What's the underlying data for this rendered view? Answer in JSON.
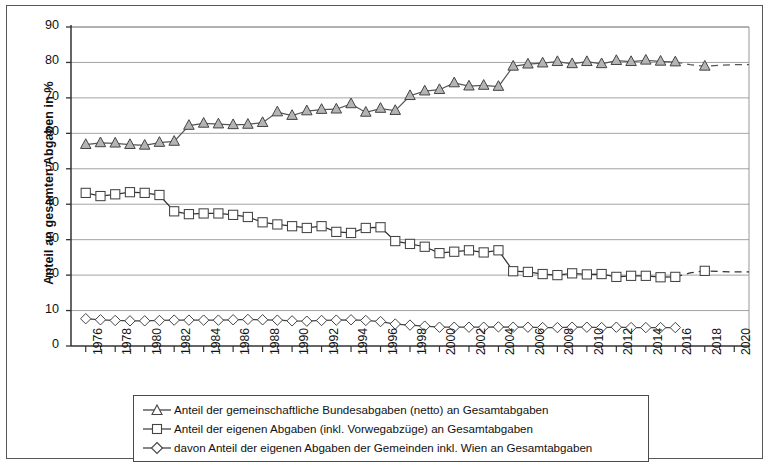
{
  "chart_data": {
    "type": "line",
    "title": "",
    "subtitle": "",
    "xlabel": "",
    "ylabel": "Anteil an gesamten Abgaben in %",
    "ylim": [
      0,
      90
    ],
    "ytick_step": 10,
    "yticks": [
      0,
      10,
      20,
      30,
      40,
      50,
      60,
      70,
      80,
      90
    ],
    "xlim": [
      1975,
      2021
    ],
    "xticks": [
      1976,
      1978,
      1980,
      1982,
      1984,
      1986,
      1988,
      1990,
      1992,
      1994,
      1996,
      1998,
      2000,
      2002,
      2004,
      2006,
      2008,
      2010,
      2012,
      2014,
      2016,
      2018,
      2020
    ],
    "x": [
      1976,
      1977,
      1978,
      1979,
      1980,
      1981,
      1982,
      1983,
      1984,
      1985,
      1986,
      1987,
      1988,
      1989,
      1990,
      1991,
      1992,
      1993,
      1994,
      1995,
      1996,
      1997,
      1998,
      1999,
      2000,
      2001,
      2002,
      2003,
      2004,
      2005,
      2006,
      2007,
      2008,
      2009,
      2010,
      2011,
      2012,
      2013,
      2014,
      2015,
      2016,
      2017,
      2018,
      2019,
      2020,
      2021
    ],
    "grid": true,
    "grid_axis": "y",
    "legend_position": "below",
    "series": [
      {
        "name": "Anteil der gemeinschaftliche Bundesabgaben (netto) an Gesamtabgaben",
        "marker": "triangle",
        "marker_fill": "#b4b4b4",
        "line_color": "#555555",
        "values": [
          56.8,
          57.3,
          57.2,
          56.8,
          56.6,
          57.4,
          57.7,
          62.2,
          62.8,
          62.6,
          62.4,
          62.5,
          63.0,
          66.0,
          65.0,
          66.3,
          66.7,
          66.8,
          68.3,
          65.9,
          67.0,
          66.4,
          70.6,
          71.9,
          72.3,
          74.2,
          73.3,
          73.5,
          73.2,
          78.9,
          79.5,
          79.8,
          80.2,
          79.6,
          80.2,
          79.6,
          80.5,
          80.2,
          80.6,
          80.3,
          80.1,
          null,
          78.9,
          null,
          null,
          null
        ],
        "projection": {
          "from_year": 2016,
          "values": [
            80.1,
            79.4,
            78.9,
            79.2,
            79.4,
            79.4
          ],
          "style": "dashed"
        }
      },
      {
        "name": "Anteil der eigenen Abgaben (inkl. Vorwegabzüge) an Gesamtabgaben",
        "marker": "square",
        "marker_fill": "#ffffff",
        "line_color": "#333333",
        "values": [
          43.2,
          42.3,
          42.8,
          43.4,
          43.2,
          42.6,
          38.0,
          37.2,
          37.4,
          37.4,
          37.0,
          36.4,
          34.9,
          34.3,
          33.8,
          33.3,
          33.8,
          32.2,
          31.9,
          33.3,
          33.5,
          29.6,
          28.8,
          28.0,
          26.2,
          26.6,
          27.0,
          26.4,
          27.0,
          21.1,
          20.9,
          20.3,
          20.0,
          20.5,
          20.2,
          20.3,
          19.5,
          19.8,
          19.8,
          19.4,
          19.5,
          null,
          21.2,
          null,
          null,
          null
        ],
        "projection": {
          "from_year": 2016,
          "values": [
            19.5,
            20.6,
            21.2,
            21.0,
            20.9,
            20.9
          ],
          "style": "dashed"
        }
      },
      {
        "name": "davon Anteil der eigenen Abgaben der Gemeinden inkl. Wien an Gesamtabgaben",
        "marker": "diamond",
        "marker_fill": "#ffffff",
        "line_color": "#444444",
        "values": [
          7.7,
          7.4,
          7.2,
          7.1,
          7.1,
          7.2,
          7.3,
          7.3,
          7.3,
          7.3,
          7.4,
          7.5,
          7.4,
          7.3,
          7.1,
          7.0,
          7.2,
          7.3,
          7.4,
          7.2,
          6.9,
          6.2,
          5.9,
          5.6,
          5.3,
          5.3,
          5.3,
          5.3,
          5.4,
          5.3,
          5.3,
          5.2,
          5.2,
          5.3,
          5.3,
          5.2,
          5.3,
          5.2,
          5.2,
          5.2,
          5.2,
          null,
          null,
          null,
          null,
          null
        ]
      }
    ]
  },
  "legend": {
    "items": [
      {
        "marker": "triangle",
        "label": "Anteil der gemeinschaftliche Bundesabgaben (netto) an Gesamtabgaben"
      },
      {
        "marker": "square",
        "label": "Anteil der eigenen Abgaben (inkl. Vorwegabzüge) an Gesamtabgaben"
      },
      {
        "marker": "diamond",
        "label": "davon Anteil der eigenen Abgaben der Gemeinden inkl. Wien an Gesamtabgaben"
      }
    ]
  },
  "colors": {
    "frame": "#585858",
    "grid": "#8c8c8c",
    "axis": "#333333",
    "triangle_fill": "#b4b4b4",
    "marker_outline": "#444444",
    "text": "#111111"
  }
}
